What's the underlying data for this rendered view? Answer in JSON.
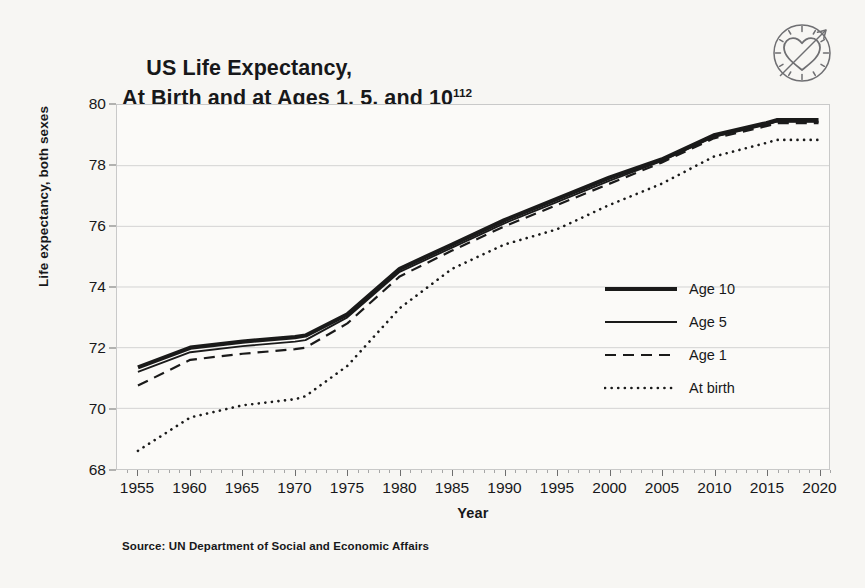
{
  "title": {
    "line1": "US Life Expectancy,",
    "line2": "At Birth and at Ages 1, 5, and 10",
    "footnote_ref": "112"
  },
  "logo": {
    "name": "heart-clock-arrow-logo"
  },
  "source": "Source: UN Department of Social and Economic Affairs",
  "legend": {
    "position": "inside-right",
    "items": [
      {
        "label": "Age 10",
        "style": "thick-solid"
      },
      {
        "label": "Age 5",
        "style": "thin-solid"
      },
      {
        "label": "Age 1",
        "style": "dashed"
      },
      {
        "label": "At birth",
        "style": "dotted"
      }
    ]
  },
  "chart_data": {
    "type": "line",
    "xlabel": "Year",
    "ylabel": "Life expectancy, both sexes",
    "xlim": [
      1953,
      2021
    ],
    "ylim": [
      68,
      80
    ],
    "ytick_labels": [
      "68",
      "70",
      "72",
      "74",
      "76",
      "78",
      "80"
    ],
    "yticks": [
      68,
      70,
      72,
      74,
      76,
      78,
      80
    ],
    "xtick_labels": [
      "1955",
      "1960",
      "1965",
      "1970",
      "1975",
      "1980",
      "1985",
      "1990",
      "1995",
      "2000",
      "2005",
      "2010",
      "2015",
      "2020"
    ],
    "xticks": [
      1955,
      1960,
      1965,
      1970,
      1975,
      1980,
      1985,
      1990,
      1995,
      2000,
      2005,
      2010,
      2015,
      2020
    ],
    "grid": "horizontal",
    "x": [
      1955,
      1960,
      1965,
      1970,
      1971,
      1975,
      1980,
      1985,
      1990,
      1995,
      2000,
      2005,
      2010,
      2015,
      2016,
      2017,
      2018,
      2019,
      2020
    ],
    "series": [
      {
        "name": "Age 10",
        "style": "thick-solid",
        "values": [
          71.35,
          72.0,
          72.2,
          72.35,
          72.4,
          73.1,
          74.6,
          75.4,
          76.2,
          76.9,
          77.6,
          78.2,
          79.0,
          79.4,
          79.5,
          79.5,
          79.5,
          79.5,
          79.5
        ]
      },
      {
        "name": "Age 5",
        "style": "thin-solid",
        "values": [
          71.2,
          71.85,
          72.05,
          72.2,
          72.25,
          73.0,
          74.5,
          75.3,
          76.1,
          76.8,
          77.5,
          78.15,
          78.95,
          79.35,
          79.45,
          79.45,
          79.45,
          79.45,
          79.45
        ]
      },
      {
        "name": "Age 1",
        "style": "dashed",
        "values": [
          70.75,
          71.6,
          71.8,
          71.95,
          72.0,
          72.8,
          74.35,
          75.2,
          76.0,
          76.7,
          77.4,
          78.1,
          78.9,
          79.3,
          79.4,
          79.4,
          79.4,
          79.4,
          79.4
        ]
      },
      {
        "name": "At birth",
        "style": "dotted",
        "values": [
          68.6,
          69.7,
          70.1,
          70.3,
          70.4,
          71.4,
          73.3,
          74.6,
          75.4,
          75.9,
          76.7,
          77.4,
          78.3,
          78.75,
          78.85,
          78.85,
          78.85,
          78.85,
          78.85
        ]
      }
    ]
  }
}
